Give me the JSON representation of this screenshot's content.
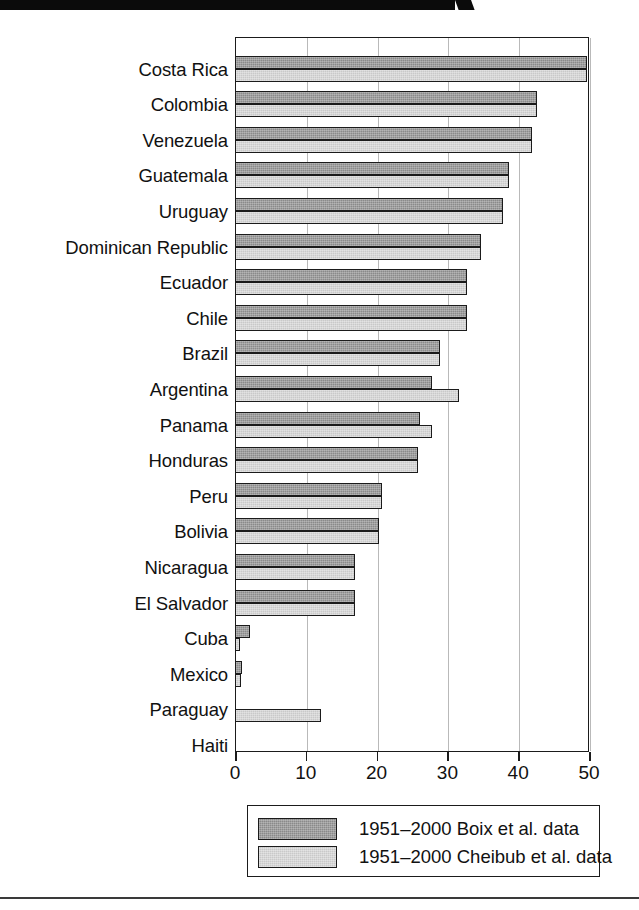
{
  "chart_data": {
    "type": "bar",
    "orientation": "horizontal",
    "title": "",
    "xlabel": "",
    "ylabel": "",
    "xlim": [
      0,
      53
    ],
    "xticks": [
      0,
      10,
      20,
      30,
      40,
      50
    ],
    "xtick_labels": [
      "0",
      "10",
      "20",
      "30",
      "40",
      "50"
    ],
    "grid": true,
    "grid_axis": "x",
    "legend_position": "below-axes",
    "categories": [
      "Costa Rica",
      "Colombia",
      "Venezuela",
      "Guatemala",
      "Uruguay",
      "Dominican Republic",
      "Ecuador",
      "Chile",
      "Brazil",
      "Argentina",
      "Panama",
      "Honduras",
      "Peru",
      "Bolivia",
      "Nicaragua",
      "El Salvador",
      "Cuba",
      "Mexico",
      "Paraguay",
      "Haiti"
    ],
    "series": [
      {
        "name": "1951–2000 Boix et al. data",
        "color": "#8a8a8a",
        "values": [
          49.7,
          42.6,
          41.9,
          38.7,
          37.8,
          34.8,
          32.8,
          32.8,
          29.0,
          27.8,
          26.1,
          25.8,
          20.8,
          20.4,
          16.9,
          16.9,
          2.1,
          1.0,
          0,
          0
        ]
      },
      {
        "name": "1951–2000 Cheibub et al. data",
        "color": "#c9c9c9",
        "values": [
          49.7,
          42.6,
          41.9,
          38.7,
          37.8,
          34.8,
          32.8,
          32.8,
          29.0,
          31.7,
          27.8,
          25.8,
          20.8,
          20.4,
          16.9,
          16.9,
          0.7,
          0.8,
          12.1,
          0
        ]
      }
    ]
  },
  "legend": {
    "items": [
      {
        "label": "1951–2000 Boix et al. data",
        "swatch": "dark"
      },
      {
        "label": "1951–2000 Cheibub et al. data",
        "swatch": "light"
      }
    ]
  }
}
